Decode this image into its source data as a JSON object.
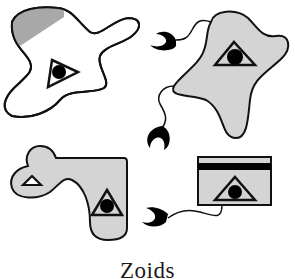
{
  "caption": "Zoids",
  "colors": {
    "outline": "#111111",
    "fill_gray": "#d4d4d4",
    "hatch_gray": "#a8a8a8",
    "white": "#ffffff",
    "black": "#000000"
  },
  "figures": [
    {
      "id": "zoid-1",
      "position": "top-left",
      "fill": "white",
      "features": [
        "hatched-corner",
        "triangle-with-eye"
      ]
    },
    {
      "id": "zoid-2",
      "position": "top-right",
      "fill": "gray",
      "features": [
        "triangle-with-eye",
        "two-tendrils-with-claws"
      ]
    },
    {
      "id": "zoid-3",
      "position": "bottom-left",
      "fill": "gray",
      "features": [
        "small-triangle",
        "triangle-with-eye"
      ]
    },
    {
      "id": "zoid-4",
      "position": "bottom-right",
      "fill": "gray",
      "features": [
        "black-bar",
        "triangle-with-eye",
        "tendril-with-claw"
      ]
    }
  ]
}
